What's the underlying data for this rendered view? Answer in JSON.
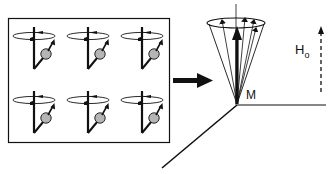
{
  "diagram": {
    "title": "",
    "colors": {
      "line": "#111111",
      "nucleus_fill": "#b5b5b5",
      "background": "#ffffff"
    },
    "spin_ensemble": {
      "rows": 2,
      "columns": 3,
      "count": 6,
      "icon": "precessing-spin-icon"
    },
    "transition_arrow": {
      "icon": "right-arrow-icon"
    },
    "labels": {
      "magnetization": "M",
      "field_main": "H",
      "field_sub": "o"
    },
    "cone": {
      "vector_count": 5,
      "main_vector": "M"
    },
    "field_arrow": {
      "style": "dashed",
      "icon": "dashed-up-arrow-icon"
    }
  }
}
